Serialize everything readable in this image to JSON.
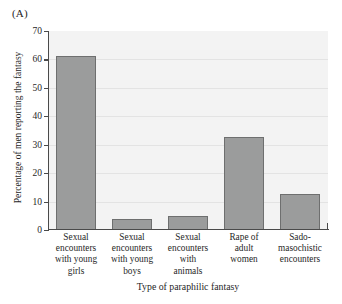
{
  "panel": {
    "label": "(A)"
  },
  "chart_data": {
    "type": "bar",
    "title": "",
    "subtitle": "",
    "xlabel": "Type of paraphilic fantasy",
    "ylabel": "Percentage of men reporting the fantasy",
    "ylim": [
      0,
      70
    ],
    "ytick_step": 10,
    "yticks": [
      0,
      10,
      20,
      30,
      40,
      50,
      60,
      70
    ],
    "ytick_labels": [
      "0",
      "10",
      "20",
      "30",
      "40",
      "50",
      "60",
      "70"
    ],
    "grid": true,
    "legend": "none",
    "categories": [
      "Sexual encounters with young girls",
      "Sexual encounters with young boys",
      "Sexual encounters with animals",
      "Rape of adult women",
      "Sado-masochistic encounters"
    ],
    "category_lines": [
      [
        "Sexual",
        "encounters",
        "with young",
        "girls"
      ],
      [
        "Sexual",
        "encounters",
        "with young",
        "boys"
      ],
      [
        "Sexual",
        "encounters",
        "with",
        "animals"
      ],
      [
        "Rape of",
        "adult",
        "women"
      ],
      [
        "Sado-",
        "masochistic",
        "encounters"
      ]
    ],
    "values": [
      61.2,
      3.7,
      5.0,
      32.7,
      12.6
    ],
    "bar_color": "#9b9c9c",
    "bar_edge_color": "#6e6f6f",
    "plot_background": "#f3f3f3",
    "gridline_color": "#e3e3e3",
    "axis_color": "#4a4a4a"
  }
}
